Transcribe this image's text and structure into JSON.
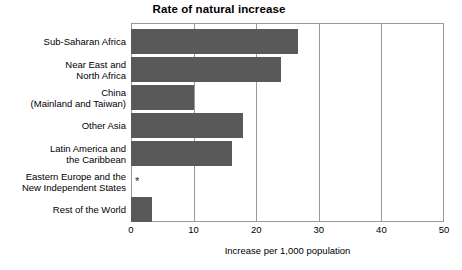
{
  "chart_data": {
    "type": "bar",
    "orientation": "horizontal",
    "title": "Rate of natural increase",
    "xlabel": "Increase per 1,000 population",
    "ylabel": "",
    "xlim": [
      0,
      50
    ],
    "xticks": [
      0,
      10,
      20,
      30,
      40,
      50
    ],
    "xtick_labels": [
      "0",
      "10",
      "20",
      "30",
      "40",
      "50"
    ],
    "grid": true,
    "grid_axis": "x",
    "legend": null,
    "bar_color": "#595959",
    "axis_color": "#9a9a9a",
    "categories": [
      "Sub-Saharan Africa",
      "Near East and\nNorth Africa",
      "China\n(Mainland and Taiwan)",
      "Other Asia",
      "Latin America and\nthe Caribbean",
      "Eastern Europe and the\nNew Independent States",
      "Rest of the World"
    ],
    "values": [
      26.7,
      24.0,
      10.0,
      17.9,
      16.1,
      0,
      3.4
    ],
    "annotations": [
      {
        "category": "Eastern Europe and the New Independent States",
        "marker": "*",
        "note": "value approximately zero, shown as asterisk"
      }
    ]
  }
}
